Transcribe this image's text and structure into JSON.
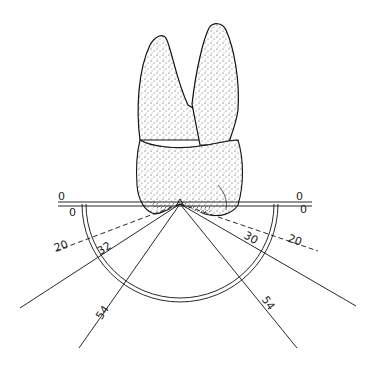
{
  "figure": {
    "apex": {
      "x": 180,
      "y": 204
    },
    "baseline": {
      "x1": 58,
      "x2": 312,
      "y": 204
    },
    "arc": {
      "cx": 180,
      "cy": 204,
      "r": 98
    },
    "labels": {
      "left_zero_outer": "0",
      "left_zero_inner": "0",
      "right_zero_outer": "0",
      "right_zero_inner": "0",
      "left_dashed": "20",
      "right_dashed": "20",
      "left_angle_1": "32",
      "left_angle_2": "54",
      "right_angle_1": "30",
      "right_angle_2": "54"
    },
    "lines": [
      {
        "name": "left-dashed-20",
        "x2": 53,
        "y2": 252,
        "dashed": true
      },
      {
        "name": "right-dashed-20",
        "x2": 318,
        "y2": 251,
        "dashed": true
      },
      {
        "name": "left-32",
        "x2": 20,
        "y2": 308,
        "dashed": false
      },
      {
        "name": "left-54",
        "x2": 79,
        "y2": 348,
        "dashed": false
      },
      {
        "name": "right-30",
        "x2": 356,
        "y2": 306,
        "dashed": false
      },
      {
        "name": "right-54",
        "x2": 297,
        "y2": 348,
        "dashed": false
      }
    ],
    "colors": {
      "ink": "#1a1a1a",
      "paper": "#ffffff"
    }
  }
}
